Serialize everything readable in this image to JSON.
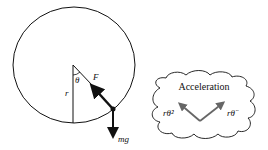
{
  "diagram": {
    "labels": {
      "theta": "θ",
      "radius": "r",
      "force": "F",
      "weight": "mg"
    },
    "cloud": {
      "title": "Acceleration",
      "left_component": "rθ̇²",
      "right_component": "rθ̈"
    },
    "colors": {
      "stroke": "#111111",
      "accel_arrow": "#666666",
      "background": "#ffffff"
    }
  }
}
